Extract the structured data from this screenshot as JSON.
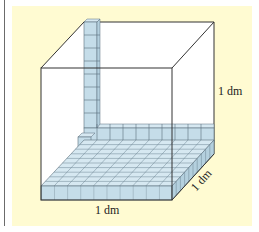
{
  "figure": {
    "background_color": "#fffbd2",
    "cube_fill": "#ffffff",
    "small_cube_fill": "#c5dde9",
    "small_cube_top_fill": "#d6e8f1",
    "small_cube_side_fill": "#b4d0de",
    "edge_color": "#333333"
  },
  "labels": {
    "height": "1 dm",
    "width": "1 dm",
    "depth": "1 dm"
  }
}
